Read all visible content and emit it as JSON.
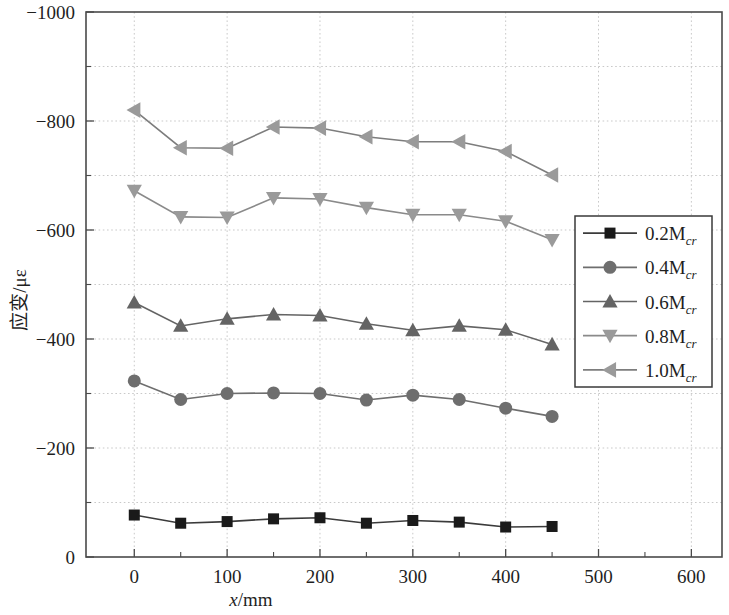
{
  "chart_data": {
    "type": "line",
    "title": "",
    "xlabel": "x/mm",
    "ylabel": "应变/με",
    "xlim": [
      -52,
      633
    ],
    "ylim": [
      -1000,
      0
    ],
    "grid": true,
    "legend_position": "right-middle",
    "x_ticks": [
      0,
      100,
      200,
      300,
      400,
      500,
      600
    ],
    "x_tick_labels": [
      "0",
      "100",
      "200",
      "300",
      "400",
      "500",
      "600"
    ],
    "x_minor_ticks": [
      50,
      150,
      250,
      350,
      450,
      550
    ],
    "y_ticks": [
      -1000,
      -800,
      -600,
      -400,
      -200,
      0
    ],
    "y_tick_labels": [
      "−1000",
      "−800",
      "−600",
      "−400",
      "−200",
      "0"
    ],
    "y_minor_ticks": [
      -900,
      -700,
      -500,
      -300,
      -100
    ],
    "x": [
      0,
      50,
      100,
      150,
      200,
      250,
      300,
      350,
      400,
      450
    ],
    "series": [
      {
        "name": "0.2Mcr",
        "label_main": "0.2M",
        "label_sub": "cr",
        "marker": "square",
        "color": "#1a1a1a",
        "line_color": "#3b3b3b",
        "values": [
          -77,
          -62,
          -65,
          -70,
          -72,
          -62,
          -67,
          -64,
          -55,
          -56
        ]
      },
      {
        "name": "0.4Mcr",
        "label_main": "0.4M",
        "label_sub": "cr",
        "marker": "circle",
        "color": "#6e6e6e",
        "line_color": "#6e6e6e",
        "values": [
          -323,
          -289,
          -300,
          -301,
          -300,
          -288,
          -297,
          -289,
          -273,
          -258
        ]
      },
      {
        "name": "0.6Mcr",
        "label_main": "0.6M",
        "label_sub": "cr",
        "marker": "triangle-up",
        "color": "#646464",
        "line_color": "#646464",
        "values": [
          -467,
          -424,
          -437,
          -445,
          -443,
          -428,
          -416,
          -424,
          -417,
          -390
        ]
      },
      {
        "name": "0.8Mcr",
        "label_main": "0.8M",
        "label_sub": "cr",
        "marker": "triangle-down",
        "color": "#9a9a9a",
        "line_color": "#8a8a8a",
        "values": [
          -672,
          -624,
          -623,
          -659,
          -657,
          -641,
          -628,
          -628,
          -616,
          -582
        ]
      },
      {
        "name": "1.0Mcr",
        "label_main": "1.0M",
        "label_sub": "cr",
        "marker": "triangle-left",
        "color": "#9a9a9a",
        "line_color": "#7d7d7d",
        "values": [
          -820,
          -751,
          -750,
          -789,
          -787,
          -771,
          -762,
          -762,
          -744,
          -701
        ]
      }
    ]
  },
  "legend": {
    "items": [
      {
        "label_main": "0.2M",
        "label_sub": "cr"
      },
      {
        "label_main": "0.4M",
        "label_sub": "cr"
      },
      {
        "label_main": "0.6M",
        "label_sub": "cr"
      },
      {
        "label_main": "0.8M",
        "label_sub": "cr"
      },
      {
        "label_main": "1.0M",
        "label_sub": "cr"
      }
    ]
  },
  "axis_titles": {
    "x_italic": "x",
    "x_rest": "/mm",
    "y_text": "应变/με"
  }
}
